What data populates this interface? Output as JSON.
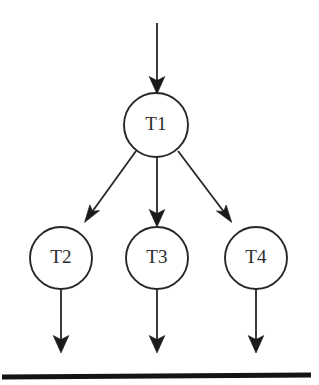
{
  "diagram": {
    "background_color": "#ffffff",
    "stroke_color": "#262626",
    "arrowhead_color": "#1a1a1a",
    "baseline_color": "#141414",
    "nodes": [
      {
        "id": "T1",
        "label": "T1",
        "cx": 156,
        "cy": 125,
        "r": 32
      },
      {
        "id": "T2",
        "label": "T2",
        "cx": 61,
        "cy": 258,
        "r": 31
      },
      {
        "id": "T3",
        "label": "T3",
        "cx": 157,
        "cy": 258,
        "r": 31
      },
      {
        "id": "T4",
        "label": "T4",
        "cx": 256,
        "cy": 258,
        "r": 31
      }
    ],
    "edges": [
      {
        "id": "entry-to-T1",
        "from": "",
        "to": "T1",
        "kind": "vertical"
      },
      {
        "id": "T1-to-T2",
        "from": "T1",
        "to": "T2",
        "kind": "diagonal-left"
      },
      {
        "id": "T1-to-T3",
        "from": "T1",
        "to": "T3",
        "kind": "vertical"
      },
      {
        "id": "T1-to-T4",
        "from": "T1",
        "to": "T4",
        "kind": "diagonal-right"
      },
      {
        "id": "T2-to-baseline",
        "from": "T2",
        "to": "baseline",
        "kind": "vertical"
      },
      {
        "id": "T3-to-baseline",
        "from": "T3",
        "to": "baseline",
        "kind": "vertical"
      },
      {
        "id": "T4-to-baseline",
        "from": "T4",
        "to": "baseline",
        "kind": "vertical"
      }
    ],
    "baseline": {
      "id": "baseline",
      "x1": 2,
      "x2": 311,
      "y": 376,
      "thickness": 5
    }
  }
}
